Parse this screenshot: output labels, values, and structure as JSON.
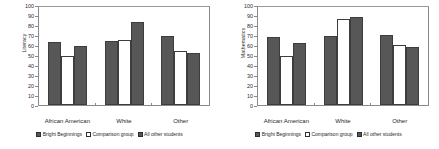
{
  "chart_data": [
    {
      "type": "bar",
      "title": "",
      "xlabel": "",
      "ylabel": "Literacy",
      "ylim": [
        0,
        100
      ],
      "yticks": [
        0,
        10,
        20,
        30,
        40,
        50,
        60,
        70,
        80,
        90,
        100
      ],
      "grid": false,
      "legend_position": "bottom",
      "categories": [
        "African American",
        "White",
        "Other"
      ],
      "series": [
        {
          "name": "Bright Beginnings",
          "values": [
            64,
            65,
            70
          ],
          "color": "#575757"
        },
        {
          "name": "Comparison group",
          "values": [
            50,
            66,
            55
          ],
          "color": "#ffffff"
        },
        {
          "name": "All other students",
          "values": [
            60,
            85,
            53
          ],
          "color": "#575757"
        }
      ]
    },
    {
      "type": "bar",
      "title": "",
      "xlabel": "",
      "ylabel": "Mathematics",
      "ylim": [
        0,
        100
      ],
      "yticks": [
        0,
        10,
        20,
        30,
        40,
        50,
        60,
        70,
        80,
        90,
        100
      ],
      "grid": false,
      "legend_position": "bottom",
      "categories": [
        "African American",
        "White",
        "Other"
      ],
      "series": [
        {
          "name": "Bright Beginnings",
          "values": [
            69,
            70,
            71
          ],
          "color": "#575757"
        },
        {
          "name": "Comparison group",
          "values": [
            50,
            88,
            61
          ],
          "color": "#ffffff"
        },
        {
          "name": "All other students",
          "values": [
            63,
            90,
            59
          ],
          "color": "#575757"
        }
      ]
    }
  ],
  "colors": {
    "bar_dark": "#575757",
    "bar_light": "#ffffff",
    "bar_outline": "#3d3d3d",
    "axis": "#8a8a8a",
    "text": "#1f1f1f",
    "background": "#ffffff"
  }
}
